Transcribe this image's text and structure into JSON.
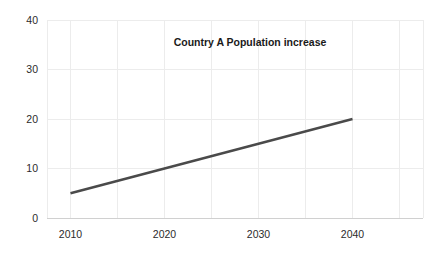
{
  "chart_data": {
    "type": "line",
    "title": "Country A Population increase",
    "xlabel": "",
    "ylabel": "",
    "x": [
      2010,
      2040
    ],
    "series": [
      {
        "name": "Country A Population increase",
        "values": [
          5,
          20
        ],
        "color": "#4a4a4a"
      }
    ],
    "xlim": [
      2007.5,
      2047.5
    ],
    "ylim": [
      0,
      40
    ],
    "x_tick_labels": [
      "2010",
      "2020",
      "2030",
      "2040"
    ],
    "x_tick_values": [
      2010,
      2020,
      2030,
      2040
    ],
    "x_gridline_values": [
      2010,
      2015,
      2020,
      2025,
      2030,
      2035,
      2040,
      2045
    ],
    "y_tick_labels": [
      "0",
      "10",
      "20",
      "30",
      "40"
    ],
    "y_tick_values": [
      0,
      10,
      20,
      30,
      40
    ],
    "grid": true,
    "grid_color": "#ececec",
    "axis_color": "#d0d0d0",
    "legend": false,
    "legend_position": "none",
    "background": "#ffffff"
  }
}
